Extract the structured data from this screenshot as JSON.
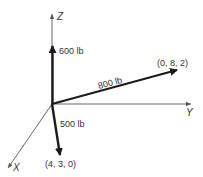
{
  "diagram": {
    "type": "3D force vector diagram",
    "axes": {
      "x": "X",
      "y": "Y",
      "z": "Z"
    },
    "forces": [
      {
        "id": "force-600",
        "magnitude_label": "600 lb",
        "direction": "+Z",
        "point_label": ""
      },
      {
        "id": "force-800",
        "magnitude_label": "800 lb",
        "direction": "toward (0, 8, 2)",
        "point_label": "(0, 8, 2)"
      },
      {
        "id": "force-500",
        "magnitude_label": "500 lb",
        "direction": "toward (4, 3, 0)",
        "point_label": "(4, 3, 0)"
      }
    ],
    "colors": {
      "axis": "#555555",
      "force": "#1a1a1a",
      "text": "#333333"
    }
  }
}
